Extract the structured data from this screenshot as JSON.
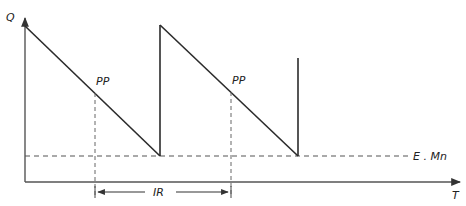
{
  "diagram": {
    "type": "inventory sawtooth (reorder point) diagram",
    "axes": {
      "y_label": "Q",
      "x_label": "T"
    },
    "labels": {
      "reorder_point_1": "PP",
      "reorder_point_2": "PP",
      "minimum_stock": "E . Mn",
      "reorder_interval": "IR"
    },
    "colors": {
      "line": "#2b2b2b",
      "axis": "#555555",
      "text": "#222222"
    }
  }
}
